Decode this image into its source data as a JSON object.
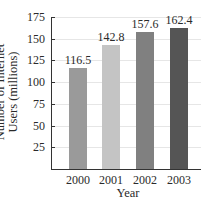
{
  "chart_data": {
    "type": "bar",
    "title": "",
    "xlabel": "Year",
    "ylabel": "Number of Internet Users (millions)",
    "ylabel_lines": [
      "Number of Internet",
      "Users (millions)"
    ],
    "categories": [
      "2000",
      "2001",
      "2002",
      "2003"
    ],
    "values": [
      116.5,
      142.8,
      157.6,
      162.4
    ],
    "value_labels": [
      "116.5",
      "142.8",
      "157.6",
      "162.4"
    ],
    "bar_colors": [
      "#9a9a9a",
      "#c4c4c4",
      "#808080",
      "#555555"
    ],
    "yticks": [
      25,
      50,
      75,
      100,
      125,
      150,
      175
    ],
    "ylim": [
      0,
      175
    ],
    "grid": true,
    "legend": null
  }
}
